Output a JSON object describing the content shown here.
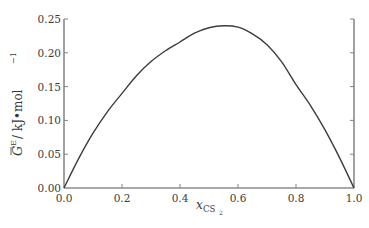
{
  "chart_data": {
    "type": "line",
    "title": "",
    "xlabel": "x_CS2",
    "ylabel": "G^E / kJ·mol^-1",
    "xlim": [
      0.0,
      1.0
    ],
    "ylim": [
      0.0,
      0.25
    ],
    "grid": false,
    "legend": null,
    "x_ticks": [
      "0.0",
      "0.2",
      "0.4",
      "0.6",
      "0.8",
      "1.0"
    ],
    "y_ticks": [
      "0.00",
      "0.05",
      "0.10",
      "0.15",
      "0.20",
      "0.25"
    ],
    "series": [
      {
        "name": "G^E",
        "x": [
          0.0,
          0.05,
          0.1,
          0.15,
          0.2,
          0.25,
          0.3,
          0.35,
          0.4,
          0.45,
          0.5,
          0.55,
          0.6,
          0.65,
          0.7,
          0.75,
          0.8,
          0.85,
          0.9,
          0.95,
          1.0
        ],
        "y": [
          0.0,
          0.043,
          0.081,
          0.113,
          0.14,
          0.166,
          0.187,
          0.203,
          0.216,
          0.229,
          0.237,
          0.24,
          0.238,
          0.228,
          0.212,
          0.187,
          0.153,
          0.122,
          0.086,
          0.045,
          0.0
        ]
      }
    ]
  },
  "labels": {
    "x_main": "x",
    "x_sub": "CS",
    "x_subsub": "2",
    "y_main": "G",
    "y_sup": "E",
    "y_unit": " / kJ•mol",
    "y_unit_sup": "−1"
  },
  "colors": {
    "line": "#3c3c3c",
    "axis": "#555555",
    "text": "#3a3a3a"
  }
}
